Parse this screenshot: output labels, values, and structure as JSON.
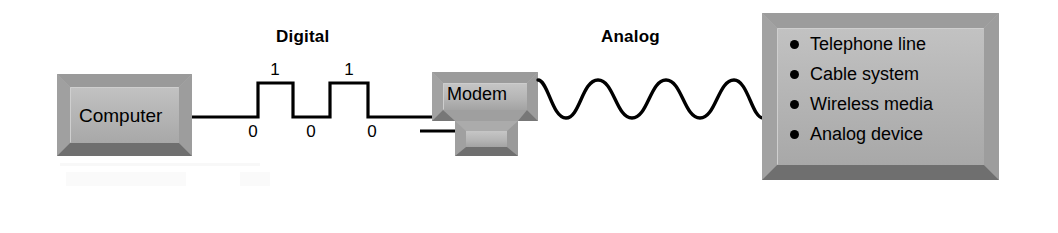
{
  "diagram": {
    "background_color": "#ffffff",
    "line_color": "#000000",
    "box_face_color": "#b3b3b3",
    "box_bevel_light": "#c9c9c9",
    "box_bevel_dark": "#8f8f8f",
    "box_bevel_darkest": "#6e6e6e"
  },
  "signal_labels": {
    "digital": "Digital",
    "analog": "Analog"
  },
  "digital_signal": {
    "type": "square-wave",
    "bit_sequence": [
      "0",
      "1",
      "0",
      "1",
      "0"
    ],
    "low_bits": [
      "0",
      "0",
      "0"
    ],
    "high_bits": [
      "1",
      "1"
    ]
  },
  "analog_signal": {
    "type": "sine-wave",
    "cycles": "2.5"
  },
  "nodes": {
    "computer": {
      "label": "Computer"
    },
    "modem": {
      "label": "Modem"
    },
    "media": {
      "items": [
        "Telephone line",
        "Cable system",
        "Wireless media",
        "Analog device"
      ]
    }
  }
}
